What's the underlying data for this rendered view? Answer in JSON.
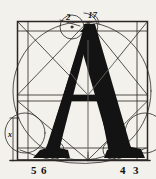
{
  "plate": {
    "title": "Geometric construction of the capital letter A",
    "letter": "A",
    "background_color": "#f3f1ec",
    "ink_color": "#141313",
    "line_color": "#2a2724",
    "width": 156,
    "height": 179
  },
  "labels": {
    "top_left": "2",
    "top_right": "17",
    "bottom_left_first": "5",
    "bottom_left_second": "6",
    "bottom_right_first": "4",
    "bottom_right_second": "3",
    "left_margin_mark": "x"
  },
  "construction": {
    "frame": {
      "x": 17,
      "y": 21,
      "width": 131,
      "height": 139
    },
    "baseline_y": 160,
    "vertical_axis_x": 88,
    "crossbar_y": 98,
    "apex": {
      "x": 88,
      "y": 25
    },
    "elements": [
      "bounding-square",
      "inner-grid-lines",
      "large-inscribed-circle",
      "corner-diagonals",
      "apex-construction-circles",
      "foot-serif-circles",
      "bottom-arc"
    ]
  }
}
